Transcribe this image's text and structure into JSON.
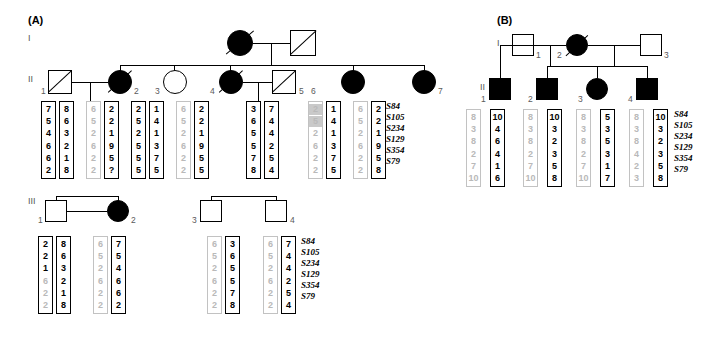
{
  "figure": {
    "panels": [
      {
        "id": "A",
        "label": "(A)"
      },
      {
        "id": "B",
        "label": "(B)"
      }
    ],
    "markers": [
      "S84",
      "S105",
      "S234",
      "S129",
      "S354",
      "S79"
    ],
    "generation_labels": {
      "I": "I",
      "II": "II",
      "III": "III"
    }
  },
  "panelA": {
    "label": "(A)",
    "gen1": {
      "label": "I",
      "individuals": [
        {
          "id": "",
          "shape": "circle",
          "filled": true,
          "deceased": true,
          "number": ""
        },
        {
          "id": "",
          "shape": "square",
          "filled": false,
          "deceased": true,
          "number": ""
        }
      ]
    },
    "gen2": {
      "label": "II",
      "individuals": [
        {
          "number": "1",
          "shape": "square",
          "filled": false,
          "deceased": true
        },
        {
          "number": "2",
          "shape": "circle",
          "filled": true,
          "deceased": true
        },
        {
          "number": "3",
          "shape": "circle",
          "filled": false,
          "deceased": false
        },
        {
          "number": "4",
          "shape": "circle",
          "filled": true,
          "deceased": true
        },
        {
          "number": "5",
          "shape": "square",
          "filled": false,
          "deceased": true
        },
        {
          "number": "6",
          "shape": "circle",
          "filled": true,
          "deceased": false
        },
        {
          "number": "7",
          "shape": "circle",
          "filled": true,
          "deceased": false
        }
      ],
      "haplotypes": [
        {
          "style": "dark",
          "alleles": [
            "7",
            "5",
            "4",
            "6",
            "6",
            "2"
          ],
          "highlight": []
        },
        {
          "style": "dark",
          "alleles": [
            "8",
            "6",
            "3",
            "2",
            "1",
            "8"
          ],
          "highlight": []
        },
        {
          "style": "grey",
          "alleles": [
            "6",
            "5",
            "2",
            "6",
            "2",
            "2"
          ],
          "highlight": []
        },
        {
          "style": "dark",
          "alleles": [
            "2",
            "2",
            "1",
            "9",
            "5",
            "?"
          ],
          "highlight": []
        },
        {
          "style": "dark",
          "alleles": [
            "2",
            "5",
            "2",
            "5",
            "5",
            "5"
          ],
          "highlight": []
        },
        {
          "style": "dark",
          "alleles": [
            "1",
            "4",
            "1",
            "3",
            "7",
            "5"
          ],
          "highlight": []
        },
        {
          "style": "grey",
          "alleles": [
            "6",
            "5",
            "2",
            "6",
            "2",
            "2"
          ],
          "highlight": []
        },
        {
          "style": "dark",
          "alleles": [
            "2",
            "2",
            "1",
            "9",
            "5",
            "5"
          ],
          "highlight": []
        },
        {
          "style": "dark",
          "alleles": [
            "3",
            "6",
            "5",
            "5",
            "7",
            "8"
          ],
          "highlight": []
        },
        {
          "style": "dark",
          "alleles": [
            "7",
            "4",
            "4",
            "2",
            "5",
            "4"
          ],
          "highlight": []
        },
        {
          "style": "grey",
          "alleles": [
            "2",
            "5",
            "2",
            "6",
            "2",
            "2"
          ],
          "highlight": [
            0,
            1
          ]
        },
        {
          "style": "dark",
          "alleles": [
            "1",
            "4",
            "1",
            "3",
            "7",
            "5"
          ],
          "highlight": []
        },
        {
          "style": "grey",
          "alleles": [
            "6",
            "5",
            "2",
            "6",
            "2",
            "2"
          ],
          "highlight": []
        },
        {
          "style": "dark",
          "alleles": [
            "2",
            "2",
            "1",
            "9",
            "5",
            "8"
          ],
          "highlight": []
        }
      ]
    },
    "gen3": {
      "label": "III",
      "individuals": [
        {
          "number": "1",
          "shape": "square",
          "filled": false,
          "deceased": false
        },
        {
          "number": "2",
          "shape": "circle",
          "filled": true,
          "deceased": false
        },
        {
          "number": "3",
          "shape": "square",
          "filled": true,
          "deceased": false
        },
        {
          "number": "4",
          "shape": "square",
          "filled": true,
          "deceased": false
        }
      ],
      "haplotypes": [
        {
          "style": "dark",
          "alleles": [
            "2",
            "2",
            "1",
            "6",
            "2",
            "2"
          ],
          "grey_from": 3
        },
        {
          "style": "dark",
          "alleles": [
            "8",
            "6",
            "3",
            "2",
            "1",
            "8"
          ],
          "grey_from": -1
        },
        {
          "style": "grey",
          "alleles": [
            "6",
            "5",
            "2",
            "6",
            "2",
            "2"
          ],
          "grey_from": -1
        },
        {
          "style": "dark",
          "alleles": [
            "7",
            "5",
            "4",
            "6",
            "6",
            "2"
          ],
          "grey_from": -1
        },
        {
          "style": "grey",
          "alleles": [
            "6",
            "5",
            "2",
            "6",
            "2",
            "2"
          ],
          "grey_from": -1
        },
        {
          "style": "dark",
          "alleles": [
            "3",
            "6",
            "5",
            "5",
            "7",
            "8"
          ],
          "grey_from": -1
        },
        {
          "style": "grey",
          "alleles": [
            "6",
            "5",
            "2",
            "6",
            "2",
            "2"
          ],
          "grey_from": -1
        },
        {
          "style": "dark",
          "alleles": [
            "7",
            "4",
            "4",
            "2",
            "5",
            "4"
          ],
          "grey_from": -1
        }
      ]
    }
  },
  "panelB": {
    "label": "(B)",
    "gen1": {
      "label": "I",
      "individuals": [
        {
          "number": "1",
          "shape": "square",
          "filled": false,
          "deceased": false
        },
        {
          "number": "2",
          "shape": "circle",
          "filled": true,
          "deceased": true
        },
        {
          "number": "3",
          "shape": "square",
          "filled": false,
          "deceased": false
        }
      ]
    },
    "gen2": {
      "label": "II",
      "individuals": [
        {
          "number": "1",
          "shape": "square",
          "filled": true,
          "deceased": false
        },
        {
          "number": "2",
          "shape": "square",
          "filled": true,
          "deceased": false
        },
        {
          "number": "3",
          "shape": "circle",
          "filled": true,
          "deceased": false
        },
        {
          "number": "4",
          "shape": "square",
          "filled": true,
          "deceased": false
        }
      ],
      "haplotypes": [
        {
          "style": "grey",
          "alleles": [
            "8",
            "3",
            "8",
            "2",
            "7",
            "10"
          ]
        },
        {
          "style": "dark",
          "alleles": [
            "10",
            "4",
            "6",
            "4",
            "1",
            "6"
          ]
        },
        {
          "style": "grey",
          "alleles": [
            "8",
            "3",
            "8",
            "2",
            "7",
            "10"
          ]
        },
        {
          "style": "dark",
          "alleles": [
            "10",
            "3",
            "2",
            "3",
            "5",
            "8"
          ]
        },
        {
          "style": "grey",
          "alleles": [
            "8",
            "3",
            "8",
            "2",
            "7",
            "10"
          ]
        },
        {
          "style": "dark",
          "alleles": [
            "5",
            "3",
            "5",
            "3",
            "1",
            "7"
          ]
        },
        {
          "style": "grey",
          "alleles": [
            "8",
            "3",
            "8",
            "4",
            "2",
            "3"
          ]
        },
        {
          "style": "dark",
          "alleles": [
            "10",
            "3",
            "2",
            "3",
            "5",
            "8"
          ]
        }
      ]
    }
  }
}
